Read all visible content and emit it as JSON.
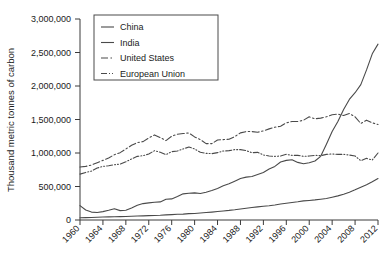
{
  "chart_data": {
    "type": "line",
    "title": "",
    "xlabel": "",
    "ylabel": "Thousand metric tonnes of carbon",
    "xlim": [
      1960,
      2012
    ],
    "ylim": [
      0,
      3000000
    ],
    "grid": false,
    "legend_position": "top-center",
    "xticks": [
      "1960",
      "1964",
      "1968",
      "1972",
      "1976",
      "1980",
      "1984",
      "1988",
      "1992",
      "1996",
      "2000",
      "2004",
      "2008",
      "2012"
    ],
    "yticks": [
      "0",
      "500,000",
      "1,000,000",
      "1,500,000",
      "2,000,000",
      "2,500,000",
      "3,000,000"
    ],
    "ytick_values": [
      0,
      500000,
      1000000,
      1500000,
      2000000,
      2500000,
      3000000
    ],
    "x": [
      1960,
      1961,
      1962,
      1963,
      1964,
      1965,
      1966,
      1967,
      1968,
      1969,
      1970,
      1971,
      1972,
      1973,
      1974,
      1975,
      1976,
      1977,
      1978,
      1979,
      1980,
      1981,
      1982,
      1983,
      1984,
      1985,
      1986,
      1987,
      1988,
      1989,
      1990,
      1991,
      1992,
      1993,
      1994,
      1995,
      1996,
      1997,
      1998,
      1999,
      2000,
      2001,
      2002,
      2003,
      2004,
      2005,
      2006,
      2007,
      2008,
      2009,
      2010,
      2011,
      2012
    ],
    "series": [
      {
        "name": "China",
        "linestyle": "solid",
        "dasharray": "none",
        "color": "#4a4a4a",
        "values": [
          215000,
          150000,
          118000,
          112000,
          125000,
          145000,
          168000,
          140000,
          145000,
          180000,
          220000,
          245000,
          255000,
          265000,
          270000,
          310000,
          315000,
          350000,
          390000,
          400000,
          405000,
          395000,
          415000,
          440000,
          470000,
          510000,
          540000,
          580000,
          620000,
          640000,
          650000,
          680000,
          710000,
          760000,
          800000,
          865000,
          890000,
          900000,
          860000,
          840000,
          855000,
          880000,
          950000,
          1130000,
          1320000,
          1470000,
          1650000,
          1800000,
          1900000,
          2020000,
          2240000,
          2480000,
          2625000
        ]
      },
      {
        "name": "India",
        "linestyle": "solid",
        "dasharray": "none",
        "color": "#4a4a4a",
        "values": [
          33000,
          35000,
          38000,
          41000,
          44000,
          46000,
          48000,
          50000,
          52000,
          56000,
          59000,
          62000,
          66000,
          68000,
          70000,
          76000,
          80000,
          85000,
          88000,
          95000,
          98000,
          105000,
          112000,
          118000,
          126000,
          135000,
          143000,
          153000,
          165000,
          175000,
          186000,
          196000,
          205000,
          213000,
          223000,
          238000,
          250000,
          262000,
          272000,
          285000,
          292000,
          300000,
          310000,
          320000,
          340000,
          360000,
          385000,
          415000,
          450000,
          490000,
          525000,
          570000,
          620000
        ]
      },
      {
        "name": "United States",
        "linestyle": "dashdot",
        "dasharray": "7,2.5,1.5,2.5",
        "color": "#4a4a4a",
        "values": [
          790000,
          800000,
          820000,
          855000,
          890000,
          925000,
          975000,
          1005000,
          1060000,
          1115000,
          1155000,
          1170000,
          1225000,
          1270000,
          1230000,
          1185000,
          1250000,
          1280000,
          1290000,
          1300000,
          1240000,
          1200000,
          1140000,
          1140000,
          1195000,
          1200000,
          1205000,
          1245000,
          1300000,
          1320000,
          1320000,
          1310000,
          1330000,
          1360000,
          1385000,
          1400000,
          1450000,
          1470000,
          1470000,
          1490000,
          1540000,
          1510000,
          1520000,
          1540000,
          1570000,
          1580000,
          1560000,
          1590000,
          1540000,
          1440000,
          1490000,
          1450000,
          1425000
        ]
      },
      {
        "name": "European Union",
        "linestyle": "dashdotdot",
        "dasharray": "6,2,1,2,1,2",
        "color": "#4a4a4a",
        "values": [
          685000,
          710000,
          730000,
          775000,
          800000,
          810000,
          825000,
          835000,
          870000,
          910000,
          950000,
          960000,
          985000,
          1035000,
          1010000,
          975000,
          1020000,
          1030000,
          1060000,
          1090000,
          1060000,
          1010000,
          995000,
          990000,
          1005000,
          1030000,
          1035000,
          1050000,
          1050000,
          1035000,
          1005000,
          1010000,
          970000,
          955000,
          950000,
          955000,
          980000,
          965000,
          965000,
          950000,
          955000,
          965000,
          960000,
          980000,
          985000,
          980000,
          980000,
          970000,
          955000,
          885000,
          920000,
          895000,
          1000000
        ]
      }
    ]
  },
  "legend": {
    "items": [
      {
        "label": "China"
      },
      {
        "label": "India"
      },
      {
        "label": "United States"
      },
      {
        "label": "European Union"
      }
    ]
  }
}
